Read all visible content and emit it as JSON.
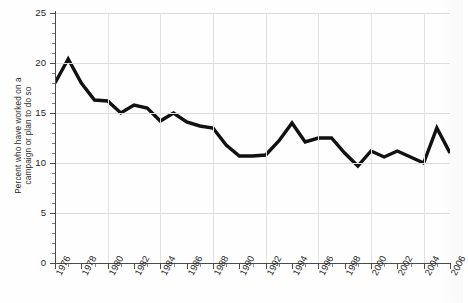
{
  "chart_data": {
    "type": "line",
    "title": "",
    "subtitle": "",
    "xlabel": "",
    "ylabel": "Percent who have worked on a campaign or plan to do so",
    "ylabel_lines": [
      "Percent who have worked on a",
      "campaign or plan to do so"
    ],
    "xlim": [
      1976,
      2006
    ],
    "ylim": [
      0,
      25
    ],
    "yticks": [
      0,
      5,
      10,
      15,
      20,
      25
    ],
    "ytick_labels": [
      "0",
      "5",
      "10",
      "15",
      "20",
      "25"
    ],
    "ytick_minor_step": 1,
    "xticks": [
      1976,
      1978,
      1980,
      1982,
      1984,
      1986,
      1988,
      1990,
      1992,
      1994,
      1996,
      1998,
      2000,
      2002,
      2004,
      2006
    ],
    "xtick_labels": [
      "1976",
      "1978",
      "1980",
      "1982",
      "1984",
      "1986",
      "1988",
      "1990",
      "1992",
      "1994",
      "1996",
      "1998",
      "2000",
      "2002",
      "2004",
      "2006"
    ],
    "xtick_minor_step": 1,
    "grid": "horizontal-and-vertical-light",
    "legend": "none",
    "line_color": "#111111",
    "line_width": 3.4,
    "x": [
      1976,
      1977,
      1978,
      1979,
      1980,
      1981,
      1982,
      1983,
      1984,
      1985,
      1986,
      1987,
      1988,
      1989,
      1990,
      1991,
      1992,
      1993,
      1994,
      1995,
      1996,
      1997,
      1998,
      1999,
      2000,
      2001,
      2002,
      2003,
      2004,
      2005,
      2006
    ],
    "values": [
      18.0,
      20.4,
      18.0,
      16.3,
      16.2,
      15.0,
      15.8,
      15.5,
      14.2,
      15.0,
      14.1,
      13.7,
      13.5,
      11.8,
      10.7,
      10.7,
      10.8,
      12.2,
      14.0,
      12.1,
      12.5,
      12.5,
      11.0,
      9.7,
      11.2,
      10.6,
      11.2,
      10.6,
      10.0,
      13.5,
      11.0
    ],
    "series": [
      {
        "name": "Percent who have worked on a campaign or plan to do so",
        "values": [
          18.0,
          20.4,
          18.0,
          16.3,
          16.2,
          15.0,
          15.8,
          15.5,
          14.2,
          15.0,
          14.1,
          13.7,
          13.5,
          11.8,
          10.7,
          10.7,
          10.8,
          12.2,
          14.0,
          12.1,
          12.5,
          12.5,
          11.0,
          9.7,
          11.2,
          10.6,
          11.2,
          10.6,
          10.0,
          13.5,
          11.0
        ]
      }
    ],
    "annotations": []
  },
  "colors": {
    "line": "#111111",
    "axis": "#4a4a4a",
    "grid": "#dcdcdc",
    "text": "#231f20",
    "background": "#ffffff"
  }
}
